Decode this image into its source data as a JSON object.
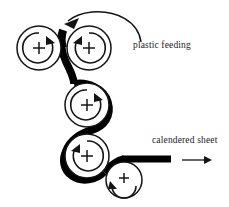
{
  "figure": {
    "background_color": "#ffffff",
    "ink_color": "#141414",
    "web_color": "#000000",
    "width": 229,
    "height": 207
  },
  "labels": {
    "feed": "plastic feeding",
    "output": "calendered sheet"
  },
  "rollers": [
    {
      "id": "roller-top-left",
      "cx": 39,
      "cy": 48,
      "r": 22,
      "spin": "counterclockwise",
      "center_mark": "+"
    },
    {
      "id": "roller-top-right",
      "cx": 89,
      "cy": 48,
      "r": 22,
      "spin": "clockwise",
      "center_mark": "+"
    },
    {
      "id": "roller-middle",
      "cx": 87,
      "cy": 105,
      "r": 22,
      "spin": "clockwise",
      "center_mark": "+"
    },
    {
      "id": "roller-lower",
      "cx": 87,
      "cy": 156,
      "r": 22,
      "spin": "clockwise",
      "center_mark": "+"
    },
    {
      "id": "roller-bottom-right",
      "cx": 124,
      "cy": 180,
      "r": 18,
      "spin": "clockwise",
      "center_mark": "+"
    }
  ],
  "web": {
    "description": "molten plastic sheet threaded through the roller nips",
    "thickness_px": 7,
    "entry": "top nip between roller-top-left and roller-top-right",
    "exit": "horizontal sheet to the right at y=158"
  },
  "arrows": {
    "feed_arrow": {
      "direction": "down-left",
      "meaning": "plastic fed into top nip"
    },
    "exit_arrow": {
      "direction": "right",
      "meaning": "finished sheet take-off",
      "x_start": 182,
      "x_end": 211,
      "y": 160
    }
  }
}
